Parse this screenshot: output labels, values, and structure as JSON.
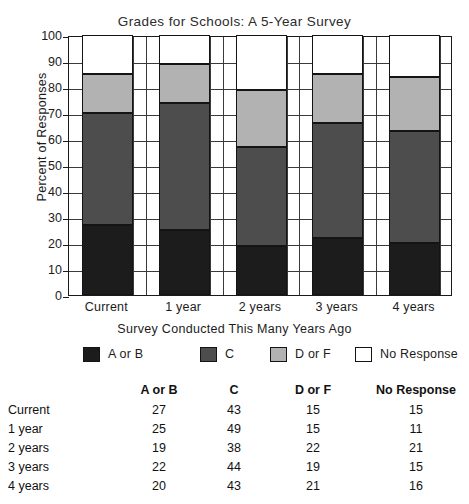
{
  "chart_data": {
    "type": "bar",
    "subtype": "stacked-bar",
    "title": "Grades for Schools: A 5-Year Survey",
    "xlabel": "Survey Conducted This Many Years Ago",
    "ylabel": "Percent of Responses",
    "ylim": [
      0,
      100
    ],
    "ytick_step": 10,
    "yticks": [
      100,
      90,
      80,
      70,
      60,
      50,
      40,
      30,
      20,
      10,
      0
    ],
    "categories": [
      "Current",
      "1 year",
      "2 years",
      "3 years",
      "4 years"
    ],
    "grid": true,
    "legend_position": "below-axis",
    "series": [
      {
        "name": "A or B",
        "color": "#1c1c1c",
        "values": [
          27,
          25,
          19,
          22,
          20
        ]
      },
      {
        "name": "C",
        "color": "#4d4d4d",
        "values": [
          43,
          49,
          38,
          44,
          43
        ]
      },
      {
        "name": "D or F",
        "color": "#b2b2b2",
        "values": [
          15,
          15,
          22,
          19,
          21
        ]
      },
      {
        "name": "No Response",
        "color": "#ffffff",
        "values": [
          15,
          11,
          21,
          15,
          16
        ]
      }
    ]
  },
  "chart": {
    "title": "Grades for Schools: A 5-Year Survey",
    "y_axis_title": "Percent of Responses",
    "x_axis_title": "Survey Conducted This Many Years Ago",
    "y_ticks": [
      "100",
      "90",
      "80",
      "70",
      "60",
      "50",
      "40",
      "30",
      "20",
      "10",
      "0"
    ],
    "x_ticks": [
      "Current",
      "1 year",
      "2 years",
      "3 years",
      "4 years"
    ]
  },
  "legend": {
    "items": [
      {
        "label": "A or B",
        "color": "#1c1c1c"
      },
      {
        "label": "C",
        "color": "#4d4d4d"
      },
      {
        "label": "D or F",
        "color": "#b2b2b2"
      },
      {
        "label": "No Response",
        "color": "#ffffff"
      }
    ]
  },
  "table": {
    "headers": [
      "",
      "A or B",
      "C",
      "D or F",
      "No Response"
    ],
    "rows": [
      {
        "label": "Current",
        "a_or_b": "27",
        "c": "43",
        "d_or_f": "15",
        "no_response": "15"
      },
      {
        "label": "1 year",
        "a_or_b": "25",
        "c": "49",
        "d_or_f": "15",
        "no_response": "11"
      },
      {
        "label": "2 years",
        "a_or_b": "19",
        "c": "38",
        "d_or_f": "22",
        "no_response": "21"
      },
      {
        "label": "3 years",
        "a_or_b": "22",
        "c": "44",
        "d_or_f": "19",
        "no_response": "15"
      },
      {
        "label": "4 years",
        "a_or_b": "20",
        "c": "43",
        "d_or_f": "21",
        "no_response": "16"
      }
    ]
  }
}
